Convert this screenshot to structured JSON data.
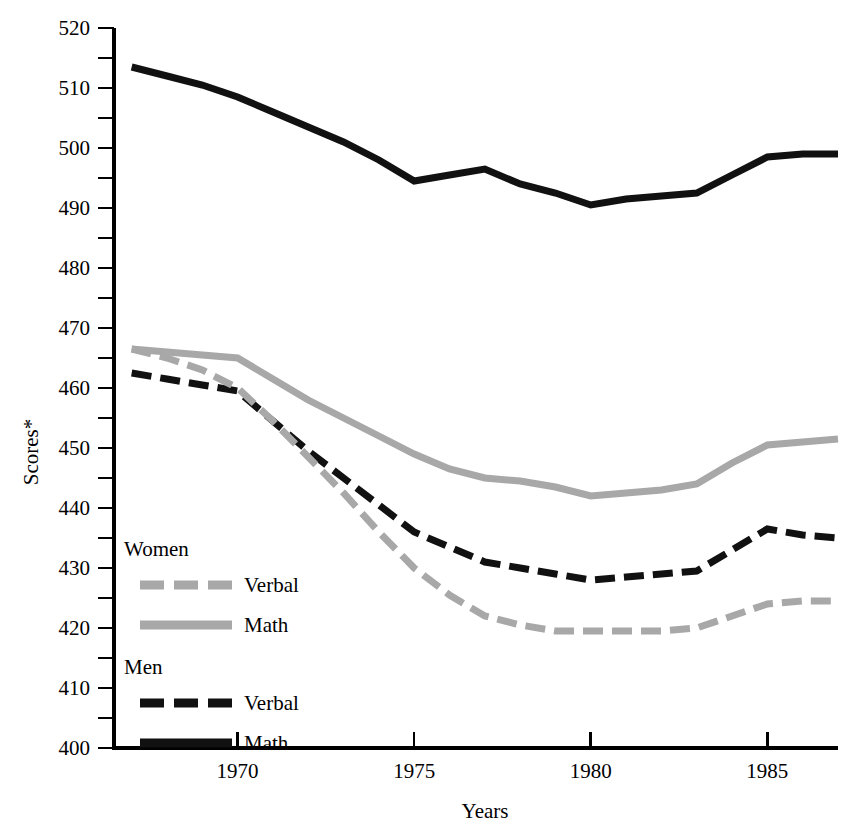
{
  "chart_data": {
    "type": "line",
    "title": "",
    "xlabel": "Years",
    "ylabel": "Scores*",
    "xlim": [
      1966.5,
      1987.0
    ],
    "ylim": [
      400,
      520
    ],
    "x_ticks": [
      1970,
      1975,
      1980,
      1985
    ],
    "x_tick_labels": [
      "1970",
      "1975",
      "1980",
      "1985"
    ],
    "y_ticks": [
      400,
      410,
      420,
      430,
      440,
      450,
      460,
      470,
      480,
      490,
      500,
      510,
      520
    ],
    "y_tick_labels": [
      "400",
      "410",
      "420",
      "430",
      "440",
      "450",
      "460",
      "470",
      "480",
      "490",
      "500",
      "510",
      "520"
    ],
    "y_minor_ticks": [
      405,
      415,
      425,
      435,
      445,
      455,
      465,
      475,
      485,
      495,
      505,
      515
    ],
    "grid": false,
    "legend_position": "inside-left",
    "x": [
      1967,
      1968,
      1969,
      1970,
      1971,
      1972,
      1973,
      1974,
      1975,
      1976,
      1977,
      1978,
      1979,
      1980,
      1981,
      1982,
      1983,
      1984,
      1985,
      1986,
      1987
    ],
    "series": [
      {
        "name": "Men Math",
        "group": "Men",
        "subject": "Math",
        "color": "#111111",
        "style": "solid",
        "width": 7,
        "values": [
          513.5,
          512.0,
          510.5,
          508.5,
          506.0,
          503.5,
          501.0,
          498.0,
          494.5,
          495.5,
          496.5,
          494.0,
          492.5,
          490.5,
          491.5,
          492.0,
          492.5,
          495.5,
          498.5,
          499.0,
          499.0
        ]
      },
      {
        "name": "Women Math",
        "group": "Women",
        "subject": "Math",
        "color": "#a8a8a8",
        "style": "solid",
        "width": 7,
        "values": [
          466.5,
          466.0,
          465.5,
          465.0,
          461.5,
          458.0,
          455.0,
          452.0,
          449.0,
          446.5,
          445.0,
          444.5,
          443.5,
          442.0,
          442.5,
          443.0,
          444.0,
          447.5,
          450.5,
          451.0,
          451.5
        ]
      },
      {
        "name": "Men Verbal",
        "group": "Men",
        "subject": "Verbal",
        "color": "#111111",
        "style": "dashed",
        "width": 7,
        "values": [
          462.5,
          461.5,
          460.5,
          459.5,
          454.5,
          449.5,
          445.0,
          440.5,
          436.0,
          433.5,
          431.0,
          430.0,
          429.0,
          428.0,
          428.5,
          429.0,
          429.5,
          433.0,
          436.5,
          435.5,
          435.0
        ]
      },
      {
        "name": "Women Verbal",
        "group": "Women",
        "subject": "Verbal",
        "color": "#a8a8a8",
        "style": "dashed",
        "width": 7,
        "values": [
          466.5,
          465.0,
          463.0,
          460.0,
          454.5,
          448.5,
          442.5,
          436.0,
          430.0,
          425.5,
          422.0,
          420.5,
          419.5,
          419.5,
          419.5,
          419.5,
          420.0,
          422.0,
          424.0,
          424.5,
          424.5
        ]
      }
    ]
  },
  "axes": {
    "y_label": "Scores*",
    "x_label": "Years"
  },
  "legend": {
    "groups": [
      {
        "heading": "Women",
        "entries": [
          {
            "label": "Verbal",
            "color": "#a8a8a8",
            "style": "dashed"
          },
          {
            "label": "Math",
            "color": "#a8a8a8",
            "style": "solid"
          }
        ]
      },
      {
        "heading": "Men",
        "entries": [
          {
            "label": "Verbal",
            "color": "#111111",
            "style": "dashed"
          },
          {
            "label": "Math",
            "color": "#111111",
            "style": "solid"
          }
        ]
      }
    ]
  }
}
